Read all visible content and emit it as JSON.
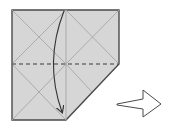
{
  "diagram": {
    "colors": {
      "paper": "#d6d6d6",
      "outline": "#4a4a4a",
      "crease": "#a6a6a6",
      "dashed": "#3a3a3a",
      "arrow": "#333333",
      "next_arrow_fill": "#ffffff",
      "next_arrow_stroke": "#4a4a4a"
    },
    "paper_outline_points": [
      [
        12,
        10
      ],
      [
        119,
        10
      ],
      [
        119,
        64
      ],
      [
        66,
        120
      ],
      [
        12,
        120
      ]
    ],
    "creases": [
      {
        "name": "vertical-center",
        "x1": 66,
        "y1": 10,
        "x2": 66,
        "y2": 120
      },
      {
        "name": "top-left-diag-a",
        "x1": 12,
        "y1": 10,
        "x2": 66,
        "y2": 64
      },
      {
        "name": "top-left-diag-b",
        "x1": 66,
        "y1": 10,
        "x2": 12,
        "y2": 64
      },
      {
        "name": "top-right-diag-a",
        "x1": 66,
        "y1": 10,
        "x2": 119,
        "y2": 64
      },
      {
        "name": "top-right-diag-b",
        "x1": 119,
        "y1": 10,
        "x2": 66,
        "y2": 64
      },
      {
        "name": "bottom-left-diag-a",
        "x1": 12,
        "y1": 64,
        "x2": 66,
        "y2": 120
      },
      {
        "name": "bottom-left-diag-b",
        "x1": 66,
        "y1": 64,
        "x2": 12,
        "y2": 120
      },
      {
        "name": "bottom-right-diag",
        "x1": 66,
        "y1": 64,
        "x2": 92,
        "y2": 92
      }
    ],
    "valley_fold": {
      "label": "valley fold line",
      "x1": 12,
      "y1": 64,
      "x2": 119,
      "y2": 64
    },
    "fold_arrow": {
      "label": "fold down",
      "path": "M64 11 Q 44 62 62 112"
    },
    "next_arrow": {
      "label": "next step",
      "points": [
        [
          117,
          104
        ],
        [
          143,
          99
        ],
        [
          143,
          90
        ],
        [
          161,
          104
        ],
        [
          143,
          117
        ],
        [
          143,
          109
        ],
        [
          117,
          105
        ]
      ]
    }
  }
}
